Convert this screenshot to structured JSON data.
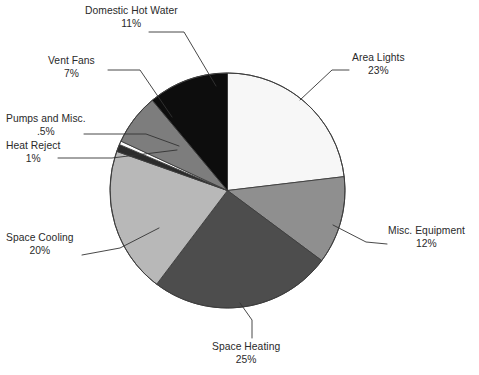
{
  "chart_data": {
    "type": "pie",
    "title": "",
    "subtitle": "",
    "xlabel": "",
    "ylabel": "",
    "legend_position": "none",
    "grid": false,
    "labels_show_percent": true,
    "start_angle_deg": 0,
    "direction": "clockwise",
    "categories": [
      "Area Lights",
      "Misc. Equipment",
      "Space Heating",
      "Space Cooling",
      "Heat Reject",
      "Pumps and Misc.",
      "Vent Fans",
      "Domestic Hot Water"
    ],
    "values": [
      23,
      12,
      25,
      20,
      1,
      0.5,
      7,
      11
    ],
    "value_labels": [
      "23%",
      "12%",
      "25%",
      "20%",
      "1%",
      ".5%",
      "7%",
      "11%"
    ],
    "colors": [
      "#f7f7f7",
      "#8f8f8f",
      "#4d4d4d",
      "#b8b8b8",
      "#2b2b2b",
      "#fbfbfb",
      "#7d7d7d",
      "#0d0d0d"
    ],
    "slice_outline_color": "#3d3d3d",
    "slices": [
      {
        "label": "Area Lights",
        "percent_label": "23%",
        "value": 23,
        "color": "#f7f7f7"
      },
      {
        "label": "Misc. Equipment",
        "percent_label": "12%",
        "value": 12,
        "color": "#8f8f8f"
      },
      {
        "label": "Space Heating",
        "percent_label": "25%",
        "value": 25,
        "color": "#4d4d4d"
      },
      {
        "label": "Space Cooling",
        "percent_label": "20%",
        "value": 20,
        "color": "#b8b8b8"
      },
      {
        "label": "Heat Reject",
        "percent_label": "1%",
        "value": 1,
        "color": "#2b2b2b"
      },
      {
        "label": "Pumps and Misc.",
        "percent_label": ".5%",
        "value": 0.5,
        "color": "#fbfbfb"
      },
      {
        "label": "Vent Fans",
        "percent_label": "7%",
        "value": 7,
        "color": "#7d7d7d"
      },
      {
        "label": "Domestic Hot Water",
        "percent_label": "11%",
        "value": 11,
        "color": "#0d0d0d"
      }
    ]
  },
  "callouts": {
    "domestic_hot_water": {
      "name": "Domestic Hot Water",
      "percent": "11%"
    },
    "vent_fans": {
      "name": "Vent Fans",
      "percent": "7%"
    },
    "pumps_and_misc": {
      "name": "Pumps and Misc.",
      "percent": ".5%"
    },
    "heat_reject": {
      "name": "Heat Reject",
      "percent": "1%"
    },
    "space_cooling": {
      "name": "Space Cooling",
      "percent": "20%"
    },
    "space_heating": {
      "name": "Space Heating",
      "percent": "25%"
    },
    "area_lights": {
      "name": "Area Lights",
      "percent": "23%"
    },
    "misc_equipment": {
      "name": "Misc. Equipment",
      "percent": "12%"
    }
  }
}
